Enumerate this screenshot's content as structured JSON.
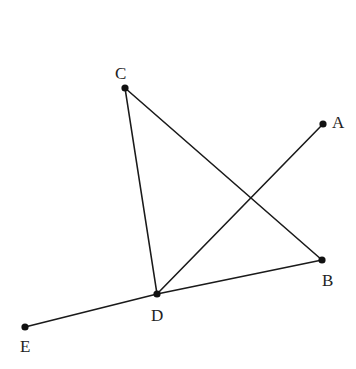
{
  "diagram": {
    "type": "geometry",
    "points": {
      "A": {
        "label": "A",
        "x": 323,
        "y": 124,
        "lx": 332,
        "ly": 128
      },
      "B": {
        "label": "B",
        "x": 322,
        "y": 260,
        "lx": 322,
        "ly": 286
      },
      "C": {
        "label": "C",
        "x": 125,
        "y": 88,
        "lx": 115,
        "ly": 79
      },
      "D": {
        "label": "D",
        "x": 157,
        "y": 294,
        "lx": 151,
        "ly": 321
      },
      "E": {
        "label": "E",
        "x": 25,
        "y": 327,
        "lx": 20,
        "ly": 352
      }
    },
    "segments": [
      [
        "C",
        "D"
      ],
      [
        "C",
        "B"
      ],
      [
        "D",
        "A"
      ],
      [
        "D",
        "B"
      ],
      [
        "E",
        "D"
      ]
    ]
  }
}
